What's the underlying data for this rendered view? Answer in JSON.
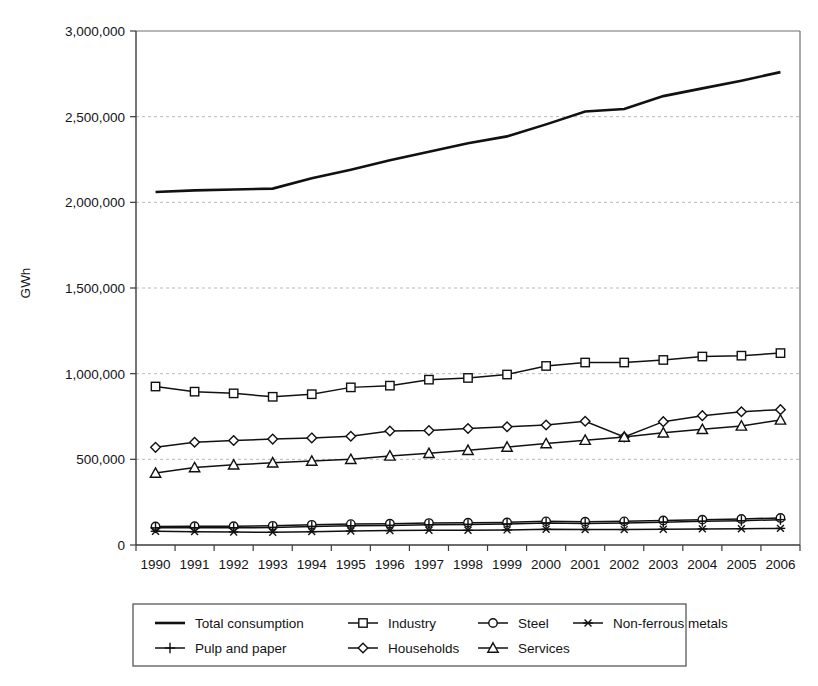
{
  "chart_data": {
    "type": "line",
    "title": "",
    "xlabel": "",
    "ylabel": "GWh",
    "ylim": [
      0,
      3000000
    ],
    "ytick_labels": [
      "3,000,000",
      "2,500,000",
      "2,000,000",
      "1,500,000",
      "1,000,000",
      "500,000",
      "0"
    ],
    "ytick_values": [
      3000000,
      2500000,
      2000000,
      1500000,
      1000000,
      500000,
      0
    ],
    "grid": true,
    "grid_axis": "y",
    "legend_position": "bottom",
    "legend_columns": 4,
    "categories": [
      "1990",
      "1991",
      "1992",
      "1993",
      "1994",
      "1995",
      "1996",
      "1997",
      "1998",
      "1999",
      "2000",
      "2001",
      "2002",
      "2003",
      "2004",
      "2005",
      "2006"
    ],
    "x": [
      1990,
      1991,
      1992,
      1993,
      1994,
      1995,
      1996,
      1997,
      1998,
      1999,
      2000,
      2001,
      2002,
      2003,
      2004,
      2005,
      2006
    ],
    "series": [
      {
        "name": "Total consumption",
        "marker": "none",
        "line": "thick",
        "values": [
          2060000,
          2070000,
          2075000,
          2080000,
          2140000,
          2190000,
          2245000,
          2295000,
          2345000,
          2385000,
          2455000,
          2530000,
          2545000,
          2620000,
          2665000,
          2710000,
          2760000
        ]
      },
      {
        "name": "Industry",
        "marker": "square",
        "line": "normal",
        "values": [
          925000,
          895000,
          885000,
          865000,
          880000,
          920000,
          930000,
          965000,
          975000,
          995000,
          1045000,
          1065000,
          1065000,
          1080000,
          1100000,
          1105000,
          1120000
        ]
      },
      {
        "name": "Steel",
        "marker": "circle",
        "line": "normal",
        "values": [
          108000,
          110000,
          110000,
          112000,
          118000,
          122000,
          124000,
          128000,
          130000,
          132000,
          138000,
          136000,
          138000,
          143000,
          148000,
          152000,
          158000
        ]
      },
      {
        "name": "Non-ferrous metals",
        "marker": "asterisk",
        "line": "normal",
        "values": [
          80000,
          78000,
          76000,
          74000,
          78000,
          82000,
          84000,
          86000,
          86000,
          88000,
          92000,
          90000,
          90000,
          92000,
          94000,
          95000,
          97000
        ]
      },
      {
        "name": "Pulp and paper",
        "marker": "plus",
        "line": "normal",
        "values": [
          100000,
          100000,
          100000,
          102000,
          108000,
          112000,
          114000,
          118000,
          120000,
          122000,
          128000,
          126000,
          128000,
          133000,
          138000,
          142000,
          148000
        ]
      },
      {
        "name": "Households",
        "marker": "diamond",
        "line": "normal",
        "values": [
          570000,
          600000,
          610000,
          618000,
          625000,
          635000,
          665000,
          668000,
          680000,
          690000,
          700000,
          722000,
          630000,
          720000,
          755000,
          778000,
          790000
        ]
      },
      {
        "name": "Services",
        "marker": "triangle",
        "line": "normal",
        "values": [
          420000,
          452000,
          468000,
          480000,
          490000,
          500000,
          520000,
          535000,
          553000,
          572000,
          592000,
          612000,
          630000,
          655000,
          675000,
          695000,
          730000
        ]
      }
    ]
  },
  "legend": {
    "entries": [
      {
        "label": "Total consumption",
        "marker": "none"
      },
      {
        "label": "Industry",
        "marker": "square"
      },
      {
        "label": "Steel",
        "marker": "circle"
      },
      {
        "label": "Non-ferrous metals",
        "marker": "asterisk"
      },
      {
        "label": "Pulp and paper",
        "marker": "plus"
      },
      {
        "label": "Households",
        "marker": "diamond"
      },
      {
        "label": "Services",
        "marker": "triangle"
      }
    ]
  },
  "colors": {
    "line": "#111111",
    "grid": "#b9b9b9",
    "axis": "#3b3b3b",
    "background": "#ffffff",
    "marker_fill": "#ffffff"
  }
}
